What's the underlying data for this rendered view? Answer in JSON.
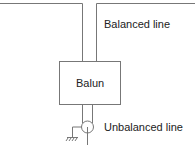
{
  "diagram": {
    "labels": {
      "balanced_line": "Balanced line",
      "balun": "Balun",
      "unbalanced_line": "Unbalanced line"
    },
    "colors": {
      "line": "#777777",
      "text": "#222222",
      "background": "#ffffff"
    },
    "components": [
      {
        "id": "balanced-line",
        "type": "two-wire line"
      },
      {
        "id": "balun",
        "type": "box"
      },
      {
        "id": "coax",
        "type": "coaxial connector"
      },
      {
        "id": "ground",
        "type": "ground symbol"
      }
    ]
  }
}
